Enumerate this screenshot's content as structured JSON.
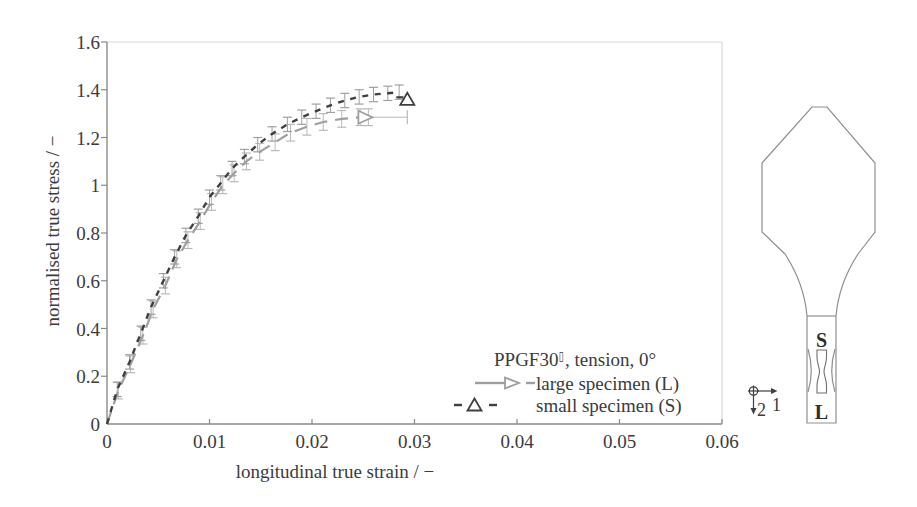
{
  "figure": {
    "x_axis_label": "longitudinal true strain / −",
    "y_axis_label": "normalised true stress / −"
  },
  "legend": {
    "title_main": "PPGF30",
    "title_sup": "▯",
    "title_rest": ", tension, 0°",
    "entries": [
      {
        "label": "large specimen (L)",
        "marker": "open-right-arrow",
        "color": "#9e9e9e"
      },
      {
        "label": "small specimen (S)",
        "marker": "open-up-triangle",
        "color": "#3f3f3f"
      }
    ]
  },
  "specimen_diagram": {
    "small_specimen_label": "S",
    "large_specimen_label": "L",
    "axis_1_label": "1",
    "axis_2_label": "2"
  },
  "colors": {
    "axis": "#8a8a8a",
    "box_light": "#d9d9d9",
    "text": "#3b3b3b",
    "series_large": "#9e9e9e",
    "series_large_err": "#b9b9b9",
    "series_small": "#3f3f3f",
    "series_small_err": "#9f9f9f",
    "outline": "#8f8f8f"
  },
  "chart_data": {
    "type": "line",
    "title": "",
    "xlabel": "longitudinal true strain / −",
    "ylabel": "normalised true stress / −",
    "xlim": [
      0,
      0.06
    ],
    "ylim": [
      0,
      1.6
    ],
    "grid": false,
    "legend_position": "lower right inside",
    "x_ticks": [
      0,
      0.01,
      0.02,
      0.03,
      0.04,
      0.05,
      0.06
    ],
    "x_tick_labels": [
      "0",
      "0.01",
      "0.02",
      "0.03",
      "0.04",
      "0.05",
      "0.06"
    ],
    "y_ticks": [
      0,
      0.2,
      0.4,
      0.6,
      0.8,
      1.0,
      1.2,
      1.4,
      1.6
    ],
    "y_tick_labels": [
      "0",
      "0.2",
      "0.4",
      "0.6",
      "0.8",
      "1",
      "1.2",
      "1.4",
      "1.6"
    ],
    "series": [
      {
        "name": "large specimen (L)",
        "style": "long-dash",
        "color": "#9e9e9e",
        "err_color": "#b9b9b9",
        "yerr": 0.035,
        "end_marker": "arrow-right",
        "x_error_to": 0.0293,
        "x": [
          0,
          0.0011,
          0.0023,
          0.0035,
          0.0045,
          0.0057,
          0.0068,
          0.0079,
          0.0091,
          0.0102,
          0.0113,
          0.0124,
          0.0136,
          0.0149,
          0.0164,
          0.0179,
          0.0195,
          0.0211,
          0.0229,
          0.0247,
          0.0255
        ],
        "y": [
          0,
          0.14,
          0.25,
          0.37,
          0.48,
          0.58,
          0.69,
          0.77,
          0.85,
          0.93,
          1.0,
          1.05,
          1.1,
          1.14,
          1.18,
          1.22,
          1.245,
          1.265,
          1.278,
          1.285,
          1.285
        ]
      },
      {
        "name": "small specimen (S)",
        "style": "short-dash",
        "color": "#3f3f3f",
        "err_color": "#9f9f9f",
        "yerr": 0.03,
        "end_marker": "triangle-up",
        "end_marker_point": [
          0.0293,
          1.36
        ],
        "x": [
          0,
          0.001,
          0.0022,
          0.0033,
          0.0043,
          0.0055,
          0.0066,
          0.0077,
          0.0089,
          0.01,
          0.0111,
          0.0122,
          0.0134,
          0.0147,
          0.0161,
          0.0176,
          0.019,
          0.0204,
          0.0218,
          0.0232,
          0.0246,
          0.026,
          0.0274,
          0.0285
        ],
        "y": [
          0,
          0.145,
          0.26,
          0.38,
          0.49,
          0.6,
          0.7,
          0.79,
          0.87,
          0.95,
          1.01,
          1.07,
          1.12,
          1.17,
          1.215,
          1.255,
          1.285,
          1.31,
          1.335,
          1.355,
          1.37,
          1.38,
          1.385,
          1.39
        ]
      }
    ]
  }
}
